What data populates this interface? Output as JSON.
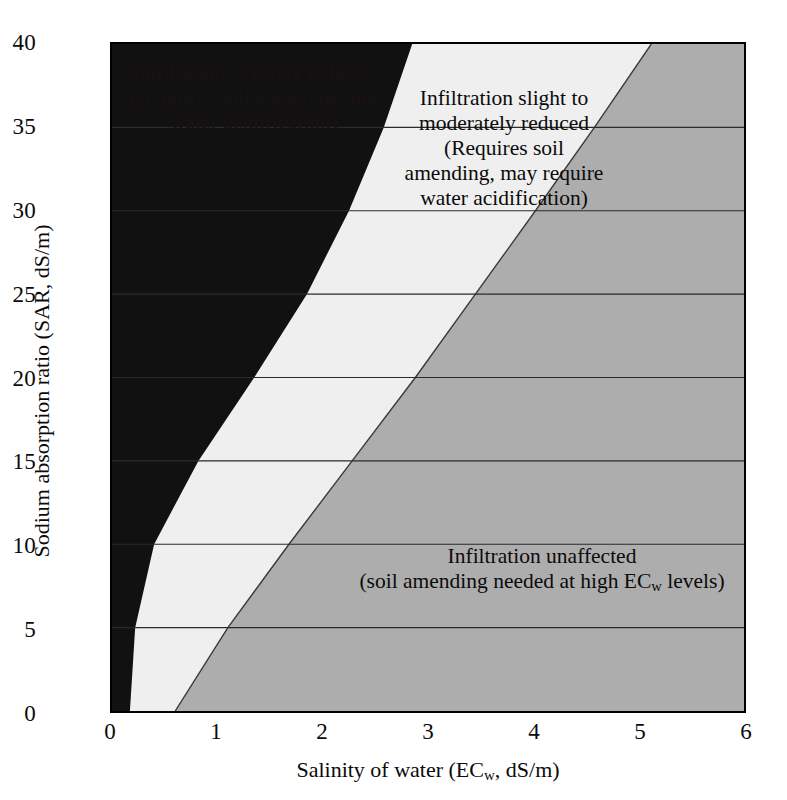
{
  "chart_data": {
    "type": "area",
    "title": "",
    "xlabel": "Salinity of water (EC_w, dS/m)",
    "ylabel": "Sodium absorption ratio (SAR, dS/m)",
    "xlim": [
      0,
      6
    ],
    "ylim": [
      0,
      40
    ],
    "xticks": [
      0,
      1,
      2,
      3,
      4,
      5,
      6
    ],
    "yticks": [
      0,
      5,
      10,
      15,
      20,
      25,
      30,
      35,
      40
    ],
    "grid": "horizontal gridlines at every y tick",
    "legend": "none (regions labeled in-place)",
    "regions": [
      {
        "name": "Infiltration severely reduced",
        "color": "#111111",
        "label": "Infiltration severely reduced\n(Requires soil amending and\nwater acidification)",
        "boundary_name": "severe/slight boundary",
        "boundary_points": [
          {
            "sar": 0,
            "ec": 0.17
          },
          {
            "sar": 5,
            "ec": 0.22
          },
          {
            "sar": 10,
            "ec": 0.4
          },
          {
            "sar": 15,
            "ec": 0.82
          },
          {
            "sar": 20,
            "ec": 1.35
          },
          {
            "sar": 25,
            "ec": 1.85
          },
          {
            "sar": 30,
            "ec": 2.25
          },
          {
            "sar": 35,
            "ec": 2.58
          },
          {
            "sar": 40,
            "ec": 2.85
          }
        ]
      },
      {
        "name": "Infiltration slight to moderately reduced",
        "color": "#efefef",
        "label": "Infiltration slight to\nmoderately reduced\n(Requires soil\namending, may require\nwater acidification)",
        "boundary_name": "slight/unaffected boundary",
        "boundary_points": [
          {
            "sar": 0,
            "ec": 0.6
          },
          {
            "sar": 5,
            "ec": 1.1
          },
          {
            "sar": 10,
            "ec": 1.68
          },
          {
            "sar": 15,
            "ec": 2.28
          },
          {
            "sar": 20,
            "ec": 2.88
          },
          {
            "sar": 25,
            "ec": 3.45
          },
          {
            "sar": 30,
            "ec": 4.02
          },
          {
            "sar": 35,
            "ec": 4.58
          },
          {
            "sar": 40,
            "ec": 5.12
          }
        ]
      },
      {
        "name": "Infiltration unaffected",
        "color": "#adadad",
        "label": "Infiltration unaffected\n(soil amending needed at high EC_w levels)",
        "boundary_name": "right edge of plot",
        "boundary_points": [
          {
            "sar": 0,
            "ec": 6
          },
          {
            "sar": 40,
            "ec": 6
          }
        ]
      }
    ]
  },
  "axes": {
    "x": {
      "title_prefix": "Salinity of water (EC",
      "title_sub": "w",
      "title_suffix": ", dS/m)",
      "ticks": [
        "0",
        "1",
        "2",
        "3",
        "4",
        "5",
        "6"
      ]
    },
    "y": {
      "title": "Sodium absorption ratio (SAR, dS/m)",
      "ticks": [
        "0",
        "5",
        "10",
        "15",
        "20",
        "25",
        "30",
        "35",
        "40"
      ]
    }
  },
  "annotations": {
    "severe": "Infiltration severely reduced\n(Requires soil amending and\nwater acidification)",
    "moderate": "Infiltration slight to\nmoderately reduced\n(Requires soil\namending, may require\nwater acidification)",
    "unaffected_line1": "Infiltration unaffected",
    "unaffected_prefix": "(soil amending needed at high EC",
    "unaffected_sub": "w",
    "unaffected_suffix": " levels)"
  },
  "colors": {
    "severe": "#111111",
    "moderate": "#efefef",
    "unaffected": "#adadad",
    "gridline": "#2b2b2b",
    "axis": "#000000",
    "text": "#0b0b0b"
  }
}
